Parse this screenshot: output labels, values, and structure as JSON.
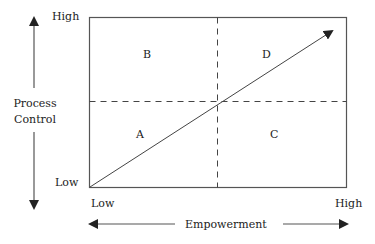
{
  "diagram": {
    "y_axis": {
      "label_line1": "Process",
      "label_line2": "Control",
      "high": "High",
      "low": "Low"
    },
    "x_axis": {
      "label": "Empowerment",
      "low": "Low",
      "high": "High"
    },
    "quadrants": {
      "top_left": "B",
      "top_right": "D",
      "bottom_left": "A",
      "bottom_right": "C"
    },
    "colors": {
      "line": "#555555",
      "text": "#222222",
      "background": "#ffffff"
    }
  }
}
